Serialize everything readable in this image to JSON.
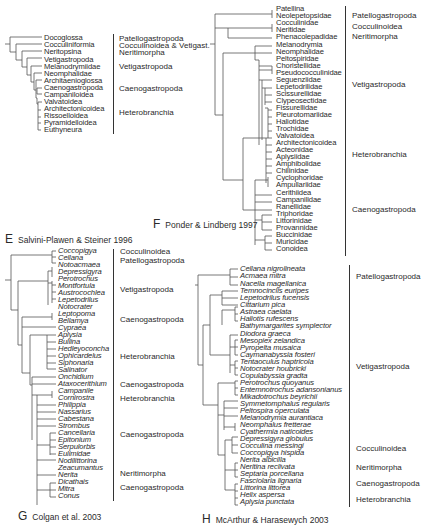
{
  "figure": {
    "panels": [
      {
        "id": "E",
        "caption_letter": "E",
        "caption_text": "Salvini-Plawen & Steiner 1996",
        "italic_taxa": false,
        "taxa": [
          "Docoglossa",
          "Cocculiniformia",
          "Neritopsina",
          "Vetigastropoda",
          "Melanodrymiidae",
          "Neomphalidae",
          "Architaenioglossa",
          "Caenogastropoda",
          "Campaniloidea",
          "Valvatoidea",
          "Architectonicoidea",
          "Rissoelloidea",
          "Pyramidelloidea",
          "Euthyneura"
        ],
        "groups": [
          {
            "label": "Patellogastropoda",
            "row": 0
          },
          {
            "label": "Cocculinoidea & Vetigast.",
            "row": 1
          },
          {
            "label": "Neritimorpha",
            "row": 2
          },
          {
            "label": "Vetigastropoda",
            "row": 4
          },
          {
            "label": "Caenogastropoda",
            "row": 7
          },
          {
            "label": "Heterobranchia",
            "row": 10.5
          }
        ]
      },
      {
        "id": "F",
        "caption_letter": "F",
        "caption_text": "Ponder & Lindberg 1997",
        "italic_taxa": false,
        "taxa": [
          "Patellina",
          "Neolepetopsidae",
          "Cocculinidae",
          "Neritidae",
          "Phenacolepadidae",
          "Melanodrymia",
          "Neomphalidae",
          "Peltospiridae",
          "Choristellidae",
          "Pseudococculinidae",
          "Seguenziidae",
          "Lepetodrilidae",
          "Scissurellidae",
          "Clypeosectidae",
          "Fissurellidae",
          "Pleurotomariidae",
          "Haliotidae",
          "Trochidae",
          "Valvatoidea",
          "Architectonicoidea",
          "Acteonidae",
          "Aplysiidae",
          "Amphibolidae",
          "Chilinidae",
          "Cyclophoridae",
          "Ampullariidae",
          "Cerithiidea",
          "Campanilidae",
          "Ranellidae",
          "Triphoridae",
          "Littorinidae",
          "Provannidae",
          "Buccinidae",
          "Muricidae",
          "Conoidea"
        ],
        "groups": [
          {
            "label": "Patellogastropoda",
            "row": 0.5
          },
          {
            "label": "Cocculinoidea",
            "row": 2
          },
          {
            "label": "Neritimorpha",
            "row": 3.3
          },
          {
            "label": "Vetigastropoda",
            "row": 11
          },
          {
            "label": "Heterobranchia",
            "row": 20.5
          },
          {
            "label": "Caenogastropoda",
            "row": 29
          }
        ]
      },
      {
        "id": "G",
        "caption_letter": "G",
        "caption_text": "Colgan et al. 2003",
        "italic_taxa": true,
        "taxa": [
          "Coccopigya",
          "Cellana",
          "Notoacmaea",
          "Depressigyra",
          "Perotrochus",
          "Montfortula",
          "Austrocochlea",
          "Lepetodrilus",
          "Notocrater",
          "Leptopoma",
          "Bellamya",
          "Cypraea",
          "Aplysia",
          "Bullina",
          "Hedleyoconcha",
          "Ophicardelus",
          "Siphonaria",
          "Salinator",
          "Onchidium",
          "Ataxocerithium",
          "Campanile",
          "Cornirostra",
          "Philippia",
          "Nassarius",
          "Cabestana",
          "Strombus",
          "Cancellaria",
          "Epitonium",
          "Serpulorbis",
          "Eulimidae",
          "Nodilittorina",
          "Zeacumantus",
          "Nerita",
          "Dicathais",
          "Mitra",
          "Conus"
        ],
        "groups": [
          {
            "label": "Cocculinoidea",
            "row": 0
          },
          {
            "label": "Patellogastropoda",
            "row": 1.3
          },
          {
            "label": "Vetigastropoda",
            "row": 5.5
          },
          {
            "label": "Caenogastropoda",
            "row": 10
          },
          {
            "label": "Heterobranchia",
            "row": 15.5
          },
          {
            "label": "Caenogastropoda",
            "row": 19.5
          },
          {
            "label": "Heterobranchia",
            "row": 21.5
          },
          {
            "label": "Caenogastropoda",
            "row": 26.5
          },
          {
            "label": "Neritimorpha",
            "row": 32
          },
          {
            "label": "Caenogastropoda",
            "row": 34
          }
        ]
      },
      {
        "id": "H",
        "caption_letter": "H",
        "caption_text": "McArthur & Harasewych 2003",
        "italic_taxa": true,
        "taxa": [
          "Cellana nigrolineata",
          "Acmaea mitra",
          "Nacella magellanica",
          "Temnocinclis euripes",
          "Lepetodrilus fucensis",
          "Cittarium pica",
          "Astraea caelata",
          "Haliotis rufescens",
          "Bathymargarites symplector",
          "Diodora graeca",
          "Mesopiex zelandica",
          "Pyropelta musaica",
          "Caymanabyssia fosteri",
          "Tentaoculus haptricola",
          "Notocrater houbricki",
          "Copulabyssia gradta",
          "Perotrochus quoyanus",
          "Entemnotrochus adansonianus",
          "Mikadotrochus beyrichii",
          "Symmetomphalus regularis",
          "Peltospira operculata",
          "Melanodrymia aurantiaca",
          "Neomphalus fretterae",
          "Cyathermia naticoides",
          "Depressigyra globulus",
          "Cocculina messingi",
          "Coccopigya hispida",
          "Nerita albicilla",
          "Neritina reclivata",
          "Septaria porcellana",
          "Fasciolaria lignaria",
          "Littorina littorea",
          "Helix aspersa",
          "Aplysia punctata"
        ],
        "groups": [
          {
            "label": "Patellogastropoda",
            "row": 1
          },
          {
            "label": "Vetigastropoda",
            "row": 14
          },
          {
            "label": "Cocculinoidea",
            "row": 25.8
          },
          {
            "label": "Neritimorpha",
            "row": 28.3
          },
          {
            "label": "Caenogastropoda",
            "row": 30.5
          },
          {
            "label": "Heterobranchia",
            "row": 32.7
          }
        ]
      }
    ]
  }
}
